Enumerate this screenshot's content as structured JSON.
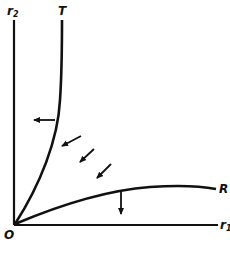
{
  "diagram": {
    "labels": {
      "y_axis": "r",
      "y_axis_sub": "2",
      "x_axis": "r",
      "x_axis_sub": "1",
      "origin": "O",
      "curve_upper": "T",
      "curve_lower": "R"
    },
    "colors": {
      "ink": "#111111",
      "background": "#ffffff"
    },
    "arrows": [
      {
        "name": "T-curve-shift-arrow",
        "direction": "left"
      },
      {
        "name": "R-curve-shift-arrow",
        "direction": "down"
      },
      {
        "name": "flow-arrow-1",
        "direction": "down-left"
      },
      {
        "name": "flow-arrow-2",
        "direction": "down-left"
      },
      {
        "name": "flow-arrow-3",
        "direction": "down-left"
      }
    ]
  }
}
